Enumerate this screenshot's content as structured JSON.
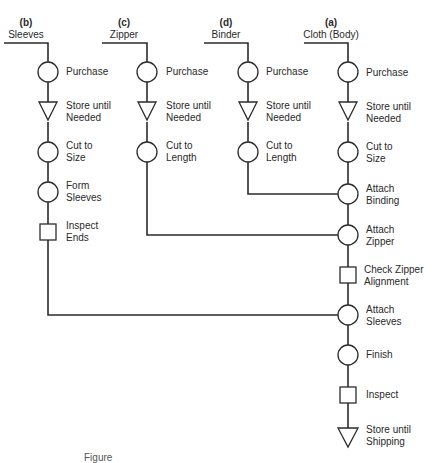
{
  "diagram": {
    "type": "assembly operation process chart",
    "columns": [
      {
        "id": "b",
        "letter": "(b)",
        "name": "Sleeves",
        "steps": [
          {
            "symbol": "operation",
            "label": "Purchase"
          },
          {
            "symbol": "storage",
            "label": "Store until Needed"
          },
          {
            "symbol": "operation",
            "label": "Cut to Size"
          },
          {
            "symbol": "operation",
            "label": "Form Sleeves"
          },
          {
            "symbol": "inspection",
            "label": "Inspect Ends"
          }
        ],
        "joins_at": "Attach Sleeves"
      },
      {
        "id": "c",
        "letter": "(c)",
        "name": "Zipper",
        "steps": [
          {
            "symbol": "operation",
            "label": "Purchase"
          },
          {
            "symbol": "storage",
            "label": "Store until Needed"
          },
          {
            "symbol": "operation",
            "label": "Cut to Length"
          }
        ],
        "joins_at": "Attach Zipper"
      },
      {
        "id": "d",
        "letter": "(d)",
        "name": "Binder",
        "steps": [
          {
            "symbol": "operation",
            "label": "Purchase"
          },
          {
            "symbol": "storage",
            "label": "Store until Needed"
          },
          {
            "symbol": "operation",
            "label": "Cut to Length"
          }
        ],
        "joins_at": "Attach Binding"
      },
      {
        "id": "a",
        "letter": "(a)",
        "name": "Cloth (Body)",
        "steps": [
          {
            "symbol": "operation",
            "label": "Purchase"
          },
          {
            "symbol": "storage",
            "label": "Store until Needed"
          },
          {
            "symbol": "operation",
            "label": "Cut to Size"
          },
          {
            "symbol": "operation",
            "label": "Attach Binding"
          },
          {
            "symbol": "operation",
            "label": "Attach Zipper"
          },
          {
            "symbol": "inspection",
            "label": "Check Zipper Alignment"
          },
          {
            "symbol": "operation",
            "label": "Attach Sleeves"
          },
          {
            "symbol": "operation",
            "label": "Finish"
          },
          {
            "symbol": "inspection",
            "label": "Inspect"
          },
          {
            "symbol": "storage",
            "label": "Store until Shipping"
          }
        ]
      }
    ],
    "labels": {
      "b": {
        "letter": "(b)",
        "name": "Sleeves",
        "s1": "Purchase",
        "s2a": "Store until",
        "s2b": "Needed",
        "s3a": "Cut to",
        "s3b": "Size",
        "s4a": "Form",
        "s4b": "Sleeves",
        "s5a": "Inspect",
        "s5b": "Ends"
      },
      "c": {
        "letter": "(c)",
        "name": "Zipper",
        "s1": "Purchase",
        "s2a": "Store until",
        "s2b": "Needed",
        "s3a": "Cut to",
        "s3b": "Length"
      },
      "d": {
        "letter": "(d)",
        "name": "Binder",
        "s1": "Purchase",
        "s2a": "Store until",
        "s2b": "Needed",
        "s3a": "Cut to",
        "s3b": "Length"
      },
      "a": {
        "letter": "(a)",
        "name": "Cloth (Body)",
        "s1": "Purchase",
        "s2a": "Store until",
        "s2b": "Needed",
        "s3a": "Cut to",
        "s3b": "Size",
        "s4a": "Attach",
        "s4b": "Binding",
        "s5a": "Attach",
        "s5b": "Zipper",
        "s6a": "Check Zipper",
        "s6b": "Alignment",
        "s7a": "Attach",
        "s7b": "Sleeves",
        "s8": "Finish",
        "s9": "Inspect",
        "s10a": "Store until",
        "s10b": "Shipping"
      }
    },
    "caption_fragment": "Figure",
    "colors": {
      "line": "#2b2b2b",
      "background": "#ffffff",
      "text": "#2a2a2a"
    }
  }
}
